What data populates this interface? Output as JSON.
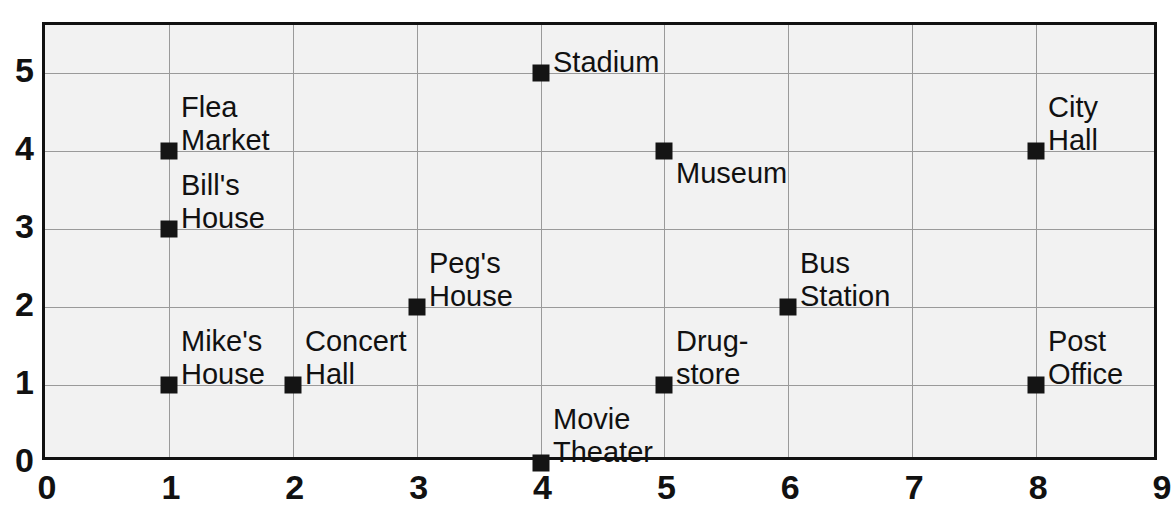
{
  "chart_data": {
    "type": "scatter",
    "title": "",
    "xlabel": "",
    "ylabel": "",
    "xlim": [
      0,
      9
    ],
    "ylim": [
      0,
      5.615
    ],
    "grid": true,
    "legend": "none",
    "xticks": [
      "0",
      "1",
      "2",
      "3",
      "4",
      "5",
      "6",
      "7",
      "8",
      "9"
    ],
    "xtick_values": [
      0,
      1,
      2,
      3,
      4,
      5,
      6,
      7,
      8,
      9
    ],
    "yticks": [
      "0",
      "1",
      "2",
      "3",
      "4",
      "5"
    ],
    "ytick_values": [
      0,
      1,
      2,
      3,
      4,
      5
    ],
    "marker_color": "#141414",
    "marker_shape": "square",
    "grid_color": "#9a9a9a",
    "plot_background": "#f2f2f2",
    "frame_color": "#111111",
    "points": [
      {
        "label": "Flea\nMarket",
        "label_line1": "Flea",
        "label_line2": "Market",
        "x": 1,
        "y": 4,
        "label_pos": "above-right"
      },
      {
        "label": "Bill's\nHouse",
        "label_line1": "Bill's",
        "label_line2": "House",
        "x": 1,
        "y": 3,
        "label_pos": "above-right"
      },
      {
        "label": "Mike's\nHouse",
        "label_line1": "Mike's",
        "label_line2": "House",
        "x": 1,
        "y": 1,
        "label_pos": "above-right"
      },
      {
        "label": "Concert\nHall",
        "label_line1": "Concert",
        "label_line2": "Hall",
        "x": 2,
        "y": 1,
        "label_pos": "above-right"
      },
      {
        "label": "Peg's\nHouse",
        "label_line1": "Peg's",
        "label_line2": "House",
        "x": 3,
        "y": 2,
        "label_pos": "above-right"
      },
      {
        "label": "Stadium",
        "label_line1": "Stadium",
        "label_line2": "",
        "x": 4,
        "y": 5,
        "label_pos": "above-right"
      },
      {
        "label": "Movie\nTheater",
        "label_line1": "Movie",
        "label_line2": "Theater",
        "x": 4,
        "y": 0,
        "label_pos": "above-right"
      },
      {
        "label": "Museum",
        "label_line1": "Museum",
        "label_line2": "",
        "x": 5,
        "y": 4,
        "label_pos": "below-right"
      },
      {
        "label": "Drug-\nstore",
        "label_line1": "Drug-",
        "label_line2": "store",
        "x": 5,
        "y": 1,
        "label_pos": "above-right"
      },
      {
        "label": "Bus\nStation",
        "label_line1": "Bus",
        "label_line2": "Station",
        "x": 6,
        "y": 2,
        "label_pos": "above-right"
      },
      {
        "label": "City\nHall",
        "label_line1": "City",
        "label_line2": "Hall",
        "x": 8,
        "y": 4,
        "label_pos": "above-right"
      },
      {
        "label": "Post\nOffice",
        "label_line1": "Post",
        "label_line2": "Office",
        "x": 8,
        "y": 1,
        "label_pos": "above-right"
      }
    ]
  }
}
